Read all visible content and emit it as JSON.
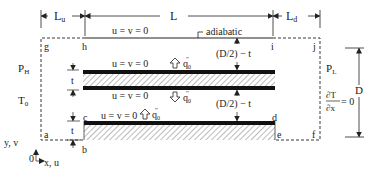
{
  "dimensions": {
    "upstream_length": "L",
    "upstream_sub": "u",
    "channel_length": "L",
    "downstream_length": "L",
    "downstream_sub": "d",
    "height": "D",
    "thickness_label": "t",
    "gap_label": "(D/2) − t"
  },
  "boundary": {
    "top_wall": "u = v = 0",
    "adiabatic": "adiabatic",
    "plate_top": "u = v = 0",
    "plate_bottom": "u = v = 0",
    "base_top": "u = v = 0",
    "inlet_pressure": "P",
    "inlet_pressure_sub": "H",
    "inlet_temp": "T",
    "inlet_temp_sub": "0",
    "outlet_pressure": "P",
    "outlet_pressure_sub": "L",
    "outlet_cond_num": "∂T",
    "outlet_cond_den": "∂x",
    "outlet_cond_eq": "= 0",
    "heat_flux": "q",
    "heat_flux_sub": "0",
    "heat_flux_sup": "″"
  },
  "corners": [
    "a",
    "b",
    "c",
    "d",
    "e",
    "f",
    "g",
    "h",
    "i",
    "j"
  ],
  "axes": {
    "y_label": "y, v",
    "x_label": "x, u",
    "origin": "0"
  },
  "colors": {
    "line": "#222222",
    "plate": "#111111",
    "hatch": "#555555",
    "background": "#ffffff"
  }
}
